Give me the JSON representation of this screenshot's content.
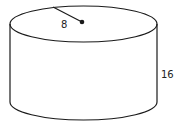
{
  "figure": {
    "shape": "cylinder",
    "radius_label": "8",
    "height_label": "16",
    "stroke_color": "#1a1a1a",
    "background_color": "#ffffff"
  }
}
